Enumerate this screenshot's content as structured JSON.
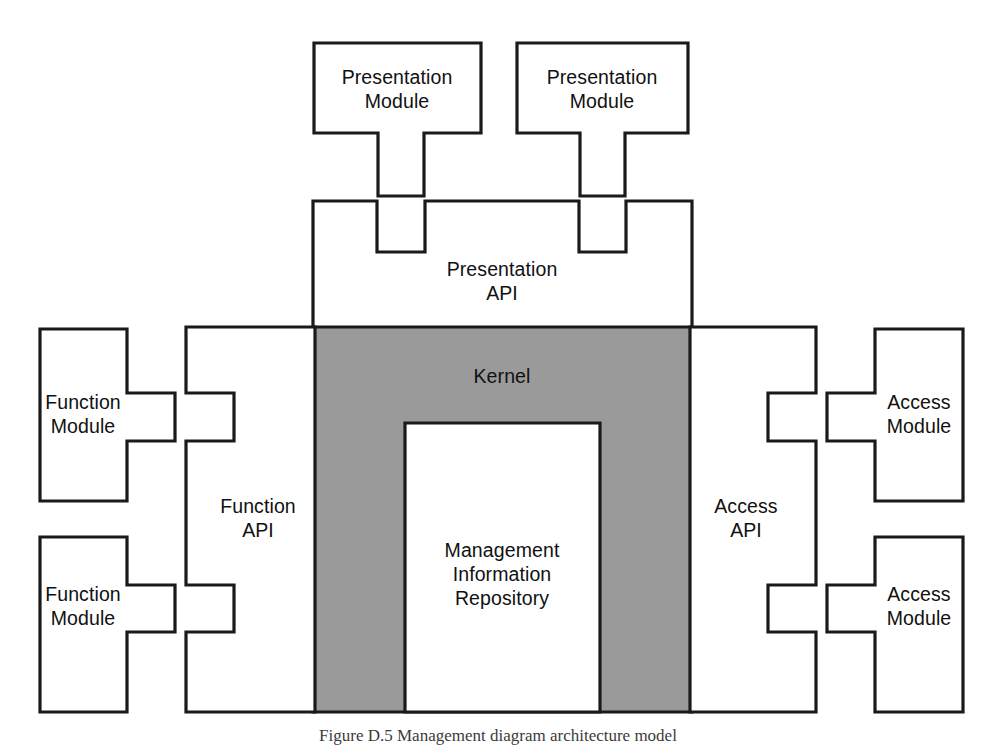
{
  "figure": {
    "caption": "Figure D.5  Management diagram architecture model",
    "background_color": "#ffffff",
    "line_color": "#1a1a1a",
    "kernel_fill_color": "#9a9a9a",
    "block_fill_color": "#ffffff"
  },
  "blocks": {
    "presentation_module_left": {
      "line1": "Presentation",
      "line2": "Module"
    },
    "presentation_module_right": {
      "line1": "Presentation",
      "line2": "Module"
    },
    "presentation_api": {
      "line1": "Presentation",
      "line2": "API"
    },
    "kernel": {
      "line1": "Kernel"
    },
    "management_information_repository": {
      "line1": "Management",
      "line2": "Information",
      "line3": "Repository"
    },
    "function_api": {
      "line1": "Function",
      "line2": "API"
    },
    "access_api": {
      "line1": "Access",
      "line2": "API"
    },
    "function_module_top": {
      "line1": "Function",
      "line2": "Module"
    },
    "function_module_bottom": {
      "line1": "Function",
      "line2": "Module"
    },
    "access_module_top": {
      "line1": "Access",
      "line2": "Module"
    },
    "access_module_bottom": {
      "line1": "Access",
      "line2": "Module"
    }
  }
}
